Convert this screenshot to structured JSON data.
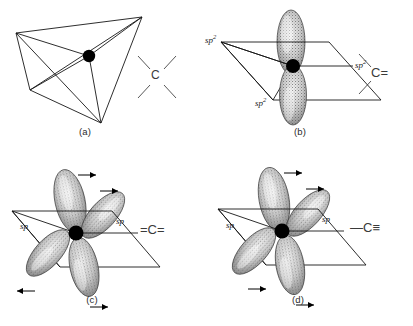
{
  "figure": {
    "background_color": "#ffffff",
    "ink_color": "#161616",
    "orbital_fill_color": "#d8d8d8",
    "orbital_stipple_color": "#3a3a3a"
  },
  "panels": [
    {
      "id": "a",
      "caption": "(a)",
      "hybridization": "sp3",
      "geometry": "tetrahedral",
      "orbital_labels": [],
      "bond_notation": {
        "atom": "C",
        "text": "C",
        "bonds": "four single bonds",
        "lines": 4
      },
      "has_p_orbital": false,
      "arrows": 0
    },
    {
      "id": "b",
      "caption": "(b)",
      "hybridization": "sp2",
      "geometry": "trigonal planar",
      "orbital_labels": [
        {
          "text": "sp",
          "sup": "2",
          "position": "left"
        },
        {
          "text": "sp",
          "sup": "2",
          "position": "right"
        },
        {
          "text": "sp",
          "sup": "2",
          "position": "bottom"
        }
      ],
      "bond_notation": {
        "atom": "C",
        "text": "C=",
        "bonds": "two single bonds and one double bond",
        "lines": 2
      },
      "has_p_orbital": true,
      "p_orbital_axis": "vertical",
      "arrows": 0
    },
    {
      "id": "c",
      "caption": "(c)",
      "hybridization": "sp",
      "geometry": "linear",
      "orbital_labels": [
        {
          "text": "sp",
          "sup": "",
          "position": "left"
        },
        {
          "text": "sp",
          "sup": "",
          "position": "right"
        }
      ],
      "bond_notation": {
        "atom": "C",
        "text": "=C=",
        "bonds": "two double bonds",
        "lines": 0
      },
      "has_p_orbital": true,
      "p_orbital_axis": "two perpendicular p orbitals",
      "arrows": 4
    },
    {
      "id": "d",
      "caption": "(d)",
      "hybridization": "sp",
      "geometry": "linear",
      "orbital_labels": [
        {
          "text": "sp",
          "sup": "",
          "position": "left"
        },
        {
          "text": "sp",
          "sup": "",
          "position": "right"
        }
      ],
      "bond_notation": {
        "atom": "C",
        "text": "C",
        "prefix": "—",
        "suffix": "≡",
        "bonds": "one single bond and one triple bond",
        "lines": 1
      },
      "has_p_orbital": true,
      "p_orbital_axis": "two perpendicular p orbitals",
      "arrows": 4
    }
  ]
}
